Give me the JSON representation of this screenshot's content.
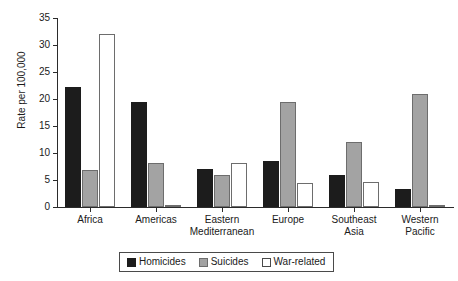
{
  "chart_data": {
    "type": "bar",
    "title": "",
    "subtitle": "",
    "xlabel": "",
    "ylabel": "Rate per 100,000",
    "ylim": [
      0,
      35
    ],
    "yticks": [
      0,
      5,
      10,
      15,
      20,
      25,
      30,
      35
    ],
    "ytick_labels": [
      "0",
      "5",
      "10",
      "15",
      "20",
      "25",
      "30",
      "35"
    ],
    "grid": false,
    "legend_position": "bottom-center",
    "categories": [
      "Africa",
      "Americas",
      "Eastern\nMediterranean",
      "Europe",
      "Southeast\nAsia",
      "Western\nPacific"
    ],
    "series": [
      {
        "name": "Homicides",
        "color": "#1c1c1c",
        "values": [
          22.2,
          19.5,
          7.1,
          8.5,
          5.9,
          3.4
        ]
      },
      {
        "name": "Suicides",
        "color": "#a3a3a3",
        "values": [
          6.8,
          8.1,
          6.0,
          19.5,
          12.1,
          21.0
        ]
      },
      {
        "name": "War-related",
        "color": "#ffffff",
        "values": [
          32.0,
          0.4,
          8.2,
          4.4,
          4.7,
          0.1
        ]
      }
    ]
  },
  "legend": {
    "items": [
      {
        "label": "Homicides",
        "swatch": "homicides"
      },
      {
        "label": "Suicides",
        "swatch": "suicides"
      },
      {
        "label": "War-related",
        "swatch": "war"
      }
    ]
  }
}
